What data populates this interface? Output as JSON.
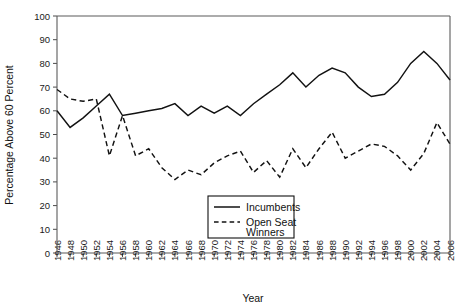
{
  "chart_data": {
    "type": "line",
    "title": "",
    "xlabel": "Year",
    "ylabel": "Percentage Above 60 Percent",
    "ylim": [
      0,
      100
    ],
    "ytick_step": 10,
    "grid": false,
    "legend_position": "inside-bottom-center",
    "x": [
      1946,
      1948,
      1950,
      1952,
      1954,
      1956,
      1958,
      1960,
      1962,
      1964,
      1966,
      1968,
      1970,
      1972,
      1974,
      1976,
      1978,
      1980,
      1982,
      1984,
      1986,
      1988,
      1990,
      1992,
      1994,
      1996,
      1998,
      2000,
      2002,
      2004,
      2006
    ],
    "categories": [
      "1946",
      "1948",
      "1950",
      "1952",
      "1954",
      "1956",
      "1958",
      "1960",
      "1962",
      "1964",
      "1966",
      "1968",
      "1970",
      "1972",
      "1974",
      "1976",
      "1978",
      "1980",
      "1982",
      "1984",
      "1986",
      "1988",
      "1990",
      "1992",
      "1994",
      "1996",
      "1998",
      "2000",
      "2002",
      "2004",
      "2006"
    ],
    "series": [
      {
        "name": "Incumbents",
        "style": "solid",
        "values": [
          60,
          53,
          57,
          62,
          67,
          58,
          59,
          60,
          61,
          63,
          58,
          62,
          59,
          62,
          58,
          63,
          67,
          71,
          76,
          70,
          75,
          78,
          76,
          70,
          66,
          67,
          72,
          80,
          85,
          80,
          73
        ]
      },
      {
        "name": "Open Seat Winners",
        "style": "dashed",
        "values": [
          69,
          65,
          64,
          65,
          41,
          58,
          41,
          44,
          36,
          31,
          35,
          33,
          38,
          41,
          43,
          34,
          39,
          32,
          44,
          36,
          44,
          51,
          40,
          43,
          46,
          45,
          41,
          35,
          42,
          55,
          46
        ]
      }
    ]
  },
  "legend": {
    "entries": [
      {
        "label": "Incumbents",
        "style": "solid"
      },
      {
        "label": "Open Seat",
        "label2": "Winners",
        "style": "dashed"
      }
    ]
  },
  "colors": {
    "line": "#121212",
    "axis": "#5b5b5b",
    "background": "#ffffff",
    "text": "#111111"
  }
}
